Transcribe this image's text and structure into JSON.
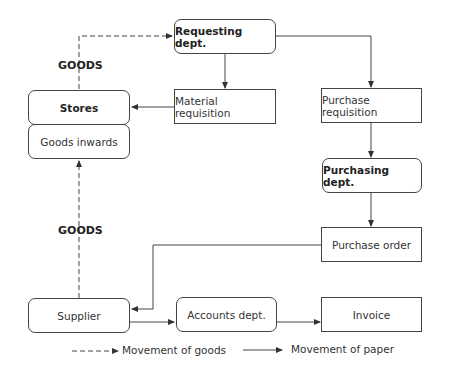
{
  "diagram": {
    "nodes": {
      "requesting_dept": "Requesting dept.",
      "stores": "Stores",
      "goods_inwards": "Goods inwards",
      "material_requisition": "Material requisition",
      "purchase_requisition": "Purchase requisition",
      "purchasing_dept": "Purchasing dept.",
      "purchase_order": "Purchase order",
      "supplier": "Supplier",
      "accounts_dept": "Accounts dept.",
      "invoice": "Invoice"
    },
    "edge_labels": {
      "goods_top": "GOODS",
      "goods_bottom": "GOODS"
    },
    "legend": {
      "goods": "Movement of goods",
      "paper": "Movement of paper"
    },
    "colors": {
      "line": "#444444",
      "text": "#222222"
    }
  }
}
